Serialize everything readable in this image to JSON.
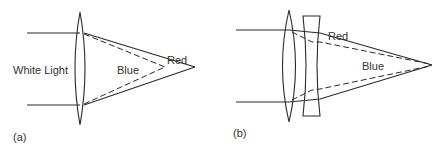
{
  "figure": {
    "type": "optics-diagram",
    "colors": {
      "line": "#2a2a2a",
      "text": "#333333",
      "background": "#ffffff"
    }
  },
  "panel_a": {
    "caption": "(a)",
    "labels": {
      "incoming": "White Light",
      "blue": "Blue",
      "red": "Red"
    },
    "elements": [
      "single biconvex lens"
    ],
    "rays": {
      "red": "solid, focuses farther from lens",
      "blue": "dashed, focuses closer to lens"
    }
  },
  "panel_b": {
    "caption": "(b)",
    "labels": {
      "blue": "Blue",
      "red": "Red"
    },
    "elements": [
      "biconvex lens",
      "plano-concave lens"
    ],
    "rays": {
      "red": "solid",
      "blue": "dashed",
      "focus": "common focal point"
    }
  }
}
